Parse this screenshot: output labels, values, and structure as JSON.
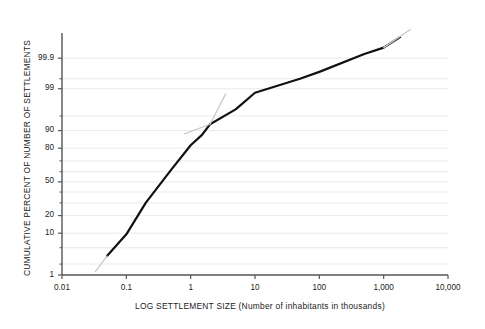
{
  "chart_data": {
    "type": "line",
    "title": "",
    "xlabel": "LOG SETTLEMENT SIZE (Number of inhabitants in thousands)",
    "ylabel": "CUMULATIVE PERCENT OF NUMBER OF SETTLEMENTS",
    "x_scale": "log10",
    "y_scale": "normal-probability",
    "xlim": [
      0.01,
      10000
    ],
    "ylim": [
      1,
      99.99
    ],
    "grid": true,
    "grid_orientation": "horizontal",
    "legend": null,
    "x_ticks": [
      {
        "value": 0.01,
        "label": "0.01"
      },
      {
        "value": 0.1,
        "label": "0.1"
      },
      {
        "value": 1,
        "label": "1"
      },
      {
        "value": 10,
        "label": "10"
      },
      {
        "value": 100,
        "label": "100"
      },
      {
        "value": 1000,
        "label": "1,000"
      },
      {
        "value": 10000,
        "label": "10,000"
      }
    ],
    "y_ticks": [
      {
        "value": 99.9,
        "label": "99.9"
      },
      {
        "value": 99,
        "label": "99"
      },
      {
        "value": 90,
        "label": "90"
      },
      {
        "value": 80,
        "label": "80"
      },
      {
        "value": 50,
        "label": "50"
      },
      {
        "value": 20,
        "label": "20"
      },
      {
        "value": 10,
        "label": "10"
      },
      {
        "value": 1,
        "label": "1"
      }
    ],
    "y_minor_ticks": [
      99.5,
      95,
      70,
      60,
      40,
      30,
      5,
      2
    ],
    "series": [
      {
        "name": "Cumulative distribution of settlements",
        "style": "solid",
        "color": "#111111",
        "width": 2.2,
        "points": [
          {
            "x": 0.05,
            "y": 3.2
          },
          {
            "x": 0.1,
            "y": 9.5
          },
          {
            "x": 0.2,
            "y": 30.0
          },
          {
            "x": 0.5,
            "y": 62.0
          },
          {
            "x": 1.0,
            "y": 82.0
          },
          {
            "x": 1.5,
            "y": 88.0
          },
          {
            "x": 2.0,
            "y": 92.5
          },
          {
            "x": 5.0,
            "y": 96.5
          },
          {
            "x": 10.0,
            "y": 98.7
          },
          {
            "x": 50.0,
            "y": 99.5
          },
          {
            "x": 100.0,
            "y": 99.7
          },
          {
            "x": 500.0,
            "y": 99.93
          },
          {
            "x": 1000.0,
            "y": 99.96
          },
          {
            "x": 1800.0,
            "y": 99.985
          }
        ]
      },
      {
        "name": "Lower-tail reference line",
        "style": "solid",
        "color": "#c9c9c9",
        "width": 1.3,
        "points": [
          {
            "x": 0.033,
            "y": 1.25
          },
          {
            "x": 0.05,
            "y": 3.2
          }
        ]
      },
      {
        "name": "Upper reference line (lognormal fit)",
        "style": "solid",
        "color": "#c9c9c9",
        "width": 1.3,
        "points": [
          {
            "x": 0.8,
            "y": 88.5
          },
          {
            "x": 2.0,
            "y": 92.5
          },
          {
            "x": 3.5,
            "y": 98.6
          }
        ]
      },
      {
        "name": "Upper-tail reference tip",
        "style": "solid",
        "color": "#c9c9c9",
        "width": 1.3,
        "points": [
          {
            "x": 1000.0,
            "y": 99.96
          },
          {
            "x": 2600.0,
            "y": 99.993
          }
        ]
      }
    ],
    "axis_color": "#555555",
    "grid_color": "#d9dde4",
    "background": "#ffffff"
  }
}
